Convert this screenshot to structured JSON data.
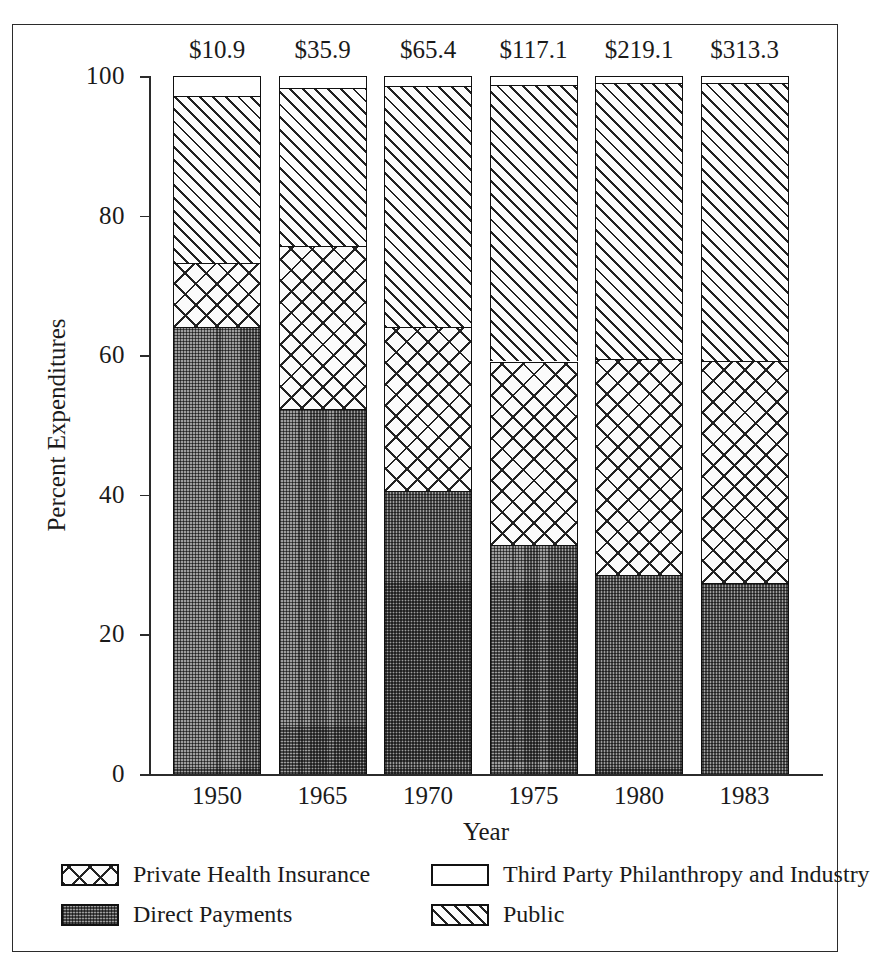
{
  "chart_data": {
    "type": "bar",
    "subtype": "stacked-percent",
    "title": "",
    "xlabel": "Year",
    "ylabel": "Percent Expenditures",
    "ylim": [
      0,
      100
    ],
    "yticks": [
      0,
      20,
      40,
      60,
      80,
      100
    ],
    "ytick_labels": [
      "0",
      "20",
      "40",
      "60",
      "80",
      "100"
    ],
    "grid": false,
    "legend_position": "below-axes",
    "categories": [
      "1950",
      "1965",
      "1970",
      "1975",
      "1980",
      "1983"
    ],
    "bar_total_labels": [
      "$10.9",
      "$35.9",
      "$65.4",
      "$117.1",
      "$219.1",
      "$313.3"
    ],
    "series": [
      {
        "name": "Direct Payments",
        "fill": "stipple",
        "values": [
          64.0,
          52.3,
          40.5,
          32.8,
          28.5,
          27.4
        ]
      },
      {
        "name": "Private Health Insurance",
        "fill": "crosshatch",
        "values": [
          9.2,
          23.4,
          23.5,
          26.3,
          30.9,
          31.8
        ]
      },
      {
        "name": "Public",
        "fill": "diagonal-hatch",
        "values": [
          23.9,
          22.6,
          34.5,
          39.6,
          39.6,
          39.8
        ]
      },
      {
        "name": "Third Party Philanthropy and Industry",
        "fill": "white",
        "values": [
          2.9,
          1.7,
          1.5,
          1.3,
          1.0,
          1.0
        ]
      }
    ],
    "stack_order_bottom_to_top": [
      "Direct Payments",
      "Private Health Insurance",
      "Public",
      "Third Party Philanthropy and Industry"
    ]
  },
  "axes": {
    "ylabel": "Percent Expenditures",
    "xlabel": "Year",
    "ytick_labels": [
      "100",
      "80",
      "60",
      "40",
      "20",
      "0"
    ]
  },
  "legend": {
    "items": [
      {
        "label": "Private Health Insurance",
        "fill": "crosshatch"
      },
      {
        "label": "Third Party Philanthropy and Industry",
        "fill": "white"
      },
      {
        "label": "Direct Payments",
        "fill": "stipple"
      },
      {
        "label": "Public",
        "fill": "diagonal-hatch"
      }
    ]
  },
  "caption": "",
  "colors": {
    "ink": "#1a1a1a",
    "frame": "#2b2b2b",
    "stipple_gray": "#9d9d9d",
    "paper": "#ffffff"
  }
}
